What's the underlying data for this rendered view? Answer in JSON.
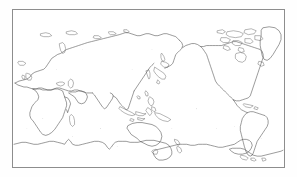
{
  "document": {
    "kind": "scanned-outline-map",
    "title": "World Map Outline",
    "description": "Black and white photocopied outline map of the world, Pacific-centered cylindrical projection, coastlines only, no labels",
    "alt_text": "World map outline showing continents as thin black coastlines on a white background inside a thin rectangular border"
  },
  "frame": {
    "border_color": "#8d8d8d",
    "background_color": "#ffffff",
    "page_background_color": "#fefefe",
    "left": 12,
    "top": 9,
    "width": 273,
    "height": 159
  },
  "map": {
    "projection": "cylindrical-equidistant",
    "center_longitude": 150,
    "longitude_range": [
      -30,
      330
    ],
    "latitude_range": [
      -85,
      84
    ],
    "coastline_color": "#4a4a4a",
    "fill_color": "none",
    "has_graticule": false,
    "has_labels": false,
    "has_legend": false,
    "has_scale_bar": false
  },
  "features": {
    "landmasses": [
      "Eurasia",
      "Africa",
      "North America",
      "South America",
      "Australia",
      "Antarctica",
      "Greenland",
      "Madagascar",
      "New Guinea",
      "Borneo",
      "Sumatra",
      "Japan",
      "New Zealand",
      "British Isles",
      "Iceland",
      "Svalbard",
      "Novaya Zemlya",
      "Canadian Arctic Archipelago",
      "Philippines",
      "Sri Lanka",
      "Cuba",
      "Tasmania",
      "Sulawesi",
      "Java",
      "Hainan",
      "Sakhalin",
      "Taiwan",
      "Tierra del Fuego",
      "Falkland Islands",
      "Hokkaido",
      "Newfoundland",
      "Baffin Island"
    ],
    "oceans_visible": [
      "Pacific Ocean",
      "Atlantic Ocean",
      "Indian Ocean",
      "Arctic Ocean",
      "Southern Ocean"
    ]
  }
}
